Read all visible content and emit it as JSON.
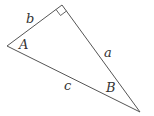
{
  "diagram": {
    "type": "right-triangle",
    "stroke_color": "#555555",
    "vertices": {
      "left": {
        "x": 7,
        "y": 46
      },
      "top": {
        "x": 62,
        "y": 5
      },
      "bottom_right": {
        "x": 140,
        "y": 112
      }
    },
    "right_angle_at": "top",
    "sides": {
      "a": {
        "label": "a",
        "x": 104,
        "y": 57
      },
      "b": {
        "label": "b",
        "x": 26,
        "y": 23
      },
      "c": {
        "label": "c",
        "x": 64,
        "y": 90
      }
    },
    "angles": {
      "A": {
        "label": "A",
        "x": 19,
        "y": 49
      },
      "B": {
        "label": "B",
        "x": 106,
        "y": 92
      }
    }
  }
}
